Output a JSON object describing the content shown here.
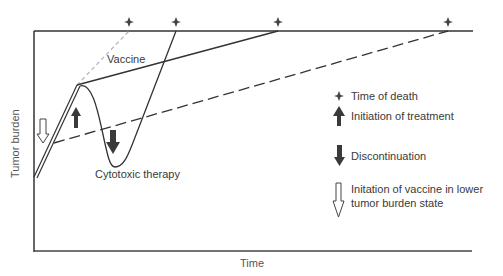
{
  "diagram": {
    "title": "",
    "axes": {
      "x_label": "Time",
      "y_label": "Tumor burden"
    },
    "curves": [
      {
        "name": "Vaccine",
        "label": "Vaccine",
        "style": "solid"
      },
      {
        "name": "Cytotoxic therapy",
        "label": "Cytotoxic therapy",
        "style": "solid"
      },
      {
        "name": "Vaccine in lower tumor burden state",
        "style": "dashed"
      },
      {
        "name": "Untreated",
        "style": "dotted-gray"
      }
    ],
    "death_markers_count": 4,
    "legend": [
      {
        "icon": "diamond-star-icon",
        "label": "Time of death"
      },
      {
        "icon": "filled-up-arrow-icon",
        "label": "Initiation of treatment"
      },
      {
        "icon": "filled-down-arrow-icon",
        "label": "Discontinuation"
      },
      {
        "icon": "hollow-down-arrow-icon",
        "label": "Initation of vaccine in lower",
        "label2": "tumor burden state"
      }
    ],
    "colors": {
      "line": "#333333",
      "untreated": "#b0b0b0",
      "arrow_fill": "#3a3a3a"
    }
  }
}
